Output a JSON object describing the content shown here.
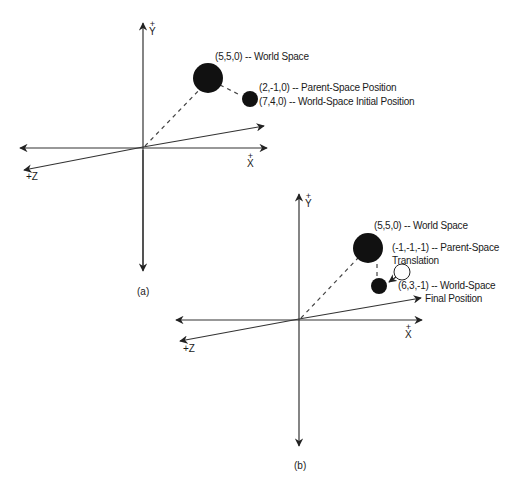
{
  "figure_a": {
    "caption": "(a)",
    "axes": {
      "y_label": "Y",
      "y_sign": "+",
      "x_label": "X",
      "x_sign": "+",
      "z_label": "+Z"
    },
    "parent_label": "(5,5,0) -- World Space",
    "child_label_1": "(2,-1,0) -- Parent-Space Position",
    "child_label_2": "(7,4,0) -- World-Space Initial Position"
  },
  "figure_b": {
    "caption": "(b)",
    "axes": {
      "y_label": "Y",
      "y_sign": "+",
      "x_label": "X",
      "x_sign": "+",
      "z_label": "+Z"
    },
    "parent_label": "(5,5,0) -- World Space",
    "translation_label_1": "(-1,-1,-1) -- Parent-Space",
    "translation_label_2": "Translation",
    "final_label_1": "(6,3,-1) -- World-Space",
    "final_label_2": "Final Position"
  },
  "colors": {
    "ink": "#111111",
    "axis": "#333333",
    "background": "#ffffff"
  }
}
